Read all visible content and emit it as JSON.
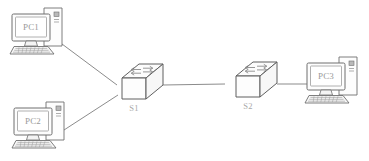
{
  "diagram": {
    "background_color": "#ffffff",
    "line_color": "#8c8c8c",
    "outline_color": "#6b6b6b",
    "label_color": "#9a9a9a",
    "fill_color": "#fbfbfb",
    "nodes": [
      {
        "id": "pc1",
        "type": "workstation",
        "label": "PC1",
        "icon": "desktop-computer-icon",
        "x": 10,
        "y": 6
      },
      {
        "id": "pc2",
        "type": "workstation",
        "label": "PC2",
        "icon": "desktop-computer-icon",
        "x": 12,
        "y": 100
      },
      {
        "id": "pc3",
        "type": "workstation",
        "label": "PC3",
        "icon": "desktop-computer-icon",
        "x": 305,
        "y": 55
      },
      {
        "id": "s1",
        "type": "switch",
        "label": "S1",
        "icon": "switch-icon",
        "x": 108,
        "y": 62
      },
      {
        "id": "s2",
        "type": "switch",
        "label": "S2",
        "icon": "switch-icon",
        "x": 222,
        "y": 60
      }
    ],
    "links": [
      {
        "id": "link-pc1-s1",
        "from": "pc1",
        "to": "s1"
      },
      {
        "id": "link-pc2-s1",
        "from": "pc2",
        "to": "s1"
      },
      {
        "id": "link-s1-s2",
        "from": "s1",
        "to": "s2"
      },
      {
        "id": "link-s2-pc3",
        "from": "s2",
        "to": "pc3"
      }
    ]
  }
}
